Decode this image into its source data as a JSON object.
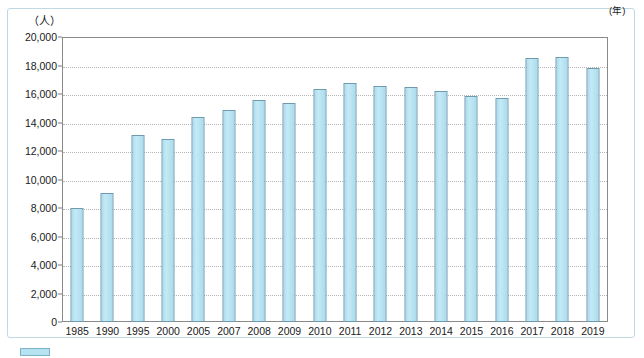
{
  "chart_data": {
    "type": "bar",
    "title": "",
    "subtitle": "",
    "xlabel": "年",
    "ylabel": "人",
    "unit_label": "（人）",
    "x_axis_unit": "(年)",
    "categories": [
      "1985",
      "1990",
      "1995",
      "2000",
      "2005",
      "2007",
      "2008",
      "2009",
      "2010",
      "2011",
      "2012",
      "2013",
      "2014",
      "2015",
      "2016",
      "2017",
      "2018",
      "2019"
    ],
    "values": [
      8000,
      9050,
      13100,
      12850,
      14400,
      14900,
      15550,
      15400,
      16350,
      16750,
      16550,
      16500,
      16200,
      15850,
      15750,
      18550,
      18600,
      17850
    ],
    "series": [
      {
        "name": "",
        "values": [
          8000,
          9050,
          13100,
          12850,
          14400,
          14900,
          15550,
          15400,
          16350,
          16750,
          16550,
          16500,
          16200,
          15850,
          15750,
          18550,
          18600,
          17850
        ]
      }
    ],
    "ylim": [
      0,
      20000
    ],
    "ytick_values": [
      0,
      2000,
      4000,
      6000,
      8000,
      10000,
      12000,
      14000,
      16000,
      18000,
      20000
    ],
    "ytick_labels": [
      "0",
      "2,000",
      "4,000",
      "6,000",
      "8,000",
      "10,000",
      "12,000",
      "14,000",
      "16,000",
      "18,000",
      "20,000"
    ],
    "grid": true,
    "grid_style": "dotted",
    "legend": false,
    "legend_position": "none",
    "bar_fill_color": "#b3e2f2",
    "bar_border_color": "#6f9bb0",
    "grid_color": "#b5b5b5",
    "axis_color": "#8a8a8a",
    "frame_color": "#bfd8e4",
    "background_color": "#ffffff",
    "text_color": "#1a1a1a"
  },
  "legend_marker": {
    "name": "legend-swatch",
    "color": "#b6e2f1"
  }
}
